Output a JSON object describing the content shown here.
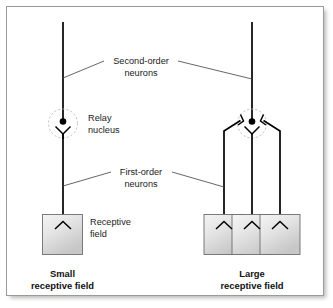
{
  "figure": {
    "title_text": "",
    "labels": {
      "second_order": "Second-order\nneurons",
      "second_order_line1": "Second-order",
      "second_order_line2": "neurons",
      "relay_nucleus_line1": "Relay",
      "relay_nucleus_line2": "nucleus",
      "first_order_line1": "First-order",
      "first_order_line2": "neurons",
      "receptive_field_line1": "Receptive",
      "receptive_field_line2": "field"
    },
    "captions": {
      "left_line1": "Small",
      "left_line2": "receptive field",
      "right_line1": "Large",
      "right_line2": "receptive field"
    },
    "colors": {
      "ink": "#000000",
      "label_text": "#1b1b1b",
      "caption_text": "#111111",
      "leader_line": "#4a4a4a",
      "frame_border": "#9a9a9a",
      "nucleus_dash": "#b4b4b4",
      "rf_box_fill_light": "#f2f2f2",
      "rf_box_fill_dark": "#c9c9c9",
      "rf_box_border": "#6e6e6e",
      "background": "#ffffff"
    },
    "panels": [
      {
        "name": "small-receptive-field",
        "receptive_field_box_count": 1,
        "first_order_neuron_count": 1,
        "second_order_neuron_count": 1
      },
      {
        "name": "large-receptive-field",
        "receptive_field_box_count": 3,
        "first_order_neuron_count": 3,
        "second_order_neuron_count": 1
      }
    ]
  }
}
